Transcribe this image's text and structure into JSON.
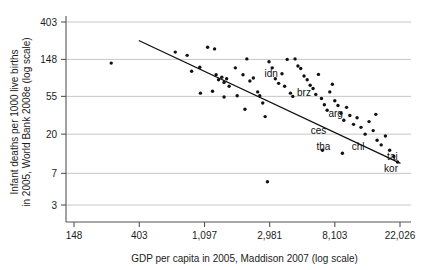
{
  "chart_data": {
    "type": "scatter",
    "title": "",
    "xlabel": "GDP per capita in 2005, Maddison 2007 (log scale)",
    "ylabel_line1": "Infant deaths per 1000 live births",
    "ylabel_line2": "in 2005, World Bank 2008e (log scale)",
    "x_scale": "log",
    "y_scale": "log",
    "xticks": [
      "148",
      "403",
      "1,097",
      "2,981",
      "8,103",
      "22,026"
    ],
    "xtick_values": [
      148,
      403,
      1097,
      2981,
      8103,
      22026
    ],
    "yticks": [
      "403",
      "148",
      "55",
      "20",
      "7",
      "3"
    ],
    "ytick_values": [
      403,
      148,
      55,
      20,
      7,
      3
    ],
    "xlim": [
      148,
      22026
    ],
    "ylim": [
      3,
      403
    ],
    "grid": "horizontal",
    "legend": "none",
    "marker_color": "#111111",
    "grid_color": "#b9b9b9",
    "axis_color": "#555555",
    "fit_line": {
      "label": "linear fit in log-log space",
      "x_start": 403,
      "y_start": 244,
      "x_end": 22026,
      "y_end": 9.2
    },
    "points": [
      {
        "x": 262,
        "y": 134
      },
      {
        "x": 700,
        "y": 180
      },
      {
        "x": 840,
        "y": 165
      },
      {
        "x": 900,
        "y": 108
      },
      {
        "x": 1020,
        "y": 120
      },
      {
        "x": 1150,
        "y": 205
      },
      {
        "x": 1280,
        "y": 196
      },
      {
        "x": 1310,
        "y": 98
      },
      {
        "x": 1360,
        "y": 86
      },
      {
        "x": 1430,
        "y": 92
      },
      {
        "x": 1480,
        "y": 80
      },
      {
        "x": 1540,
        "y": 88
      },
      {
        "x": 1600,
        "y": 72
      },
      {
        "x": 1480,
        "y": 54
      },
      {
        "x": 1760,
        "y": 118
      },
      {
        "x": 1980,
        "y": 98
      },
      {
        "x": 2100,
        "y": 150
      },
      {
        "x": 2200,
        "y": 83
      },
      {
        "x": 2320,
        "y": 90
      },
      {
        "x": 2480,
        "y": 62
      },
      {
        "x": 2560,
        "y": 56
      },
      {
        "x": 2680,
        "y": 46
      },
      {
        "x": 2780,
        "y": 32
      },
      {
        "x": 2950,
        "y": 139
      },
      {
        "x": 3100,
        "y": 118
      },
      {
        "x": 3250,
        "y": 88
      },
      {
        "x": 3420,
        "y": 78
      },
      {
        "x": 3600,
        "y": 101
      },
      {
        "x": 3750,
        "y": 72
      },
      {
        "x": 3900,
        "y": 148
      },
      {
        "x": 4100,
        "y": 60
      },
      {
        "x": 4250,
        "y": 55
      },
      {
        "x": 4400,
        "y": 150
      },
      {
        "x": 4600,
        "y": 124
      },
      {
        "x": 4800,
        "y": 116
      },
      {
        "x": 5050,
        "y": 95
      },
      {
        "x": 5300,
        "y": 86
      },
      {
        "x": 5550,
        "y": 74
      },
      {
        "x": 5800,
        "y": 68
      },
      {
        "x": 6050,
        "y": 58
      },
      {
        "x": 6300,
        "y": 99
      },
      {
        "x": 6600,
        "y": 52
      },
      {
        "x": 6900,
        "y": 44
      },
      {
        "x": 7200,
        "y": 38
      },
      {
        "x": 7500,
        "y": 62
      },
      {
        "x": 7800,
        "y": 76
      },
      {
        "x": 8100,
        "y": 49
      },
      {
        "x": 8500,
        "y": 43
      },
      {
        "x": 8900,
        "y": 35
      },
      {
        "x": 9300,
        "y": 29
      },
      {
        "x": 9700,
        "y": 41
      },
      {
        "x": 10200,
        "y": 33
      },
      {
        "x": 10800,
        "y": 26
      },
      {
        "x": 11400,
        "y": 31
      },
      {
        "x": 12100,
        "y": 24
      },
      {
        "x": 12900,
        "y": 20
      },
      {
        "x": 13700,
        "y": 28
      },
      {
        "x": 14600,
        "y": 22
      },
      {
        "x": 15500,
        "y": 17
      },
      {
        "x": 16500,
        "y": 15
      },
      {
        "x": 17600,
        "y": 19
      },
      {
        "x": 18800,
        "y": 13
      },
      {
        "x": 20000,
        "y": 11
      },
      {
        "x": 21200,
        "y": 9.5
      },
      {
        "x": 2880,
        "y": 5.6
      },
      {
        "x": 15200,
        "y": 34
      },
      {
        "x": 1030,
        "y": 60
      },
      {
        "x": 1240,
        "y": 63
      },
      {
        "x": 1810,
        "y": 56
      },
      {
        "x": 2040,
        "y": 39
      },
      {
        "x": 6700,
        "y": 13
      },
      {
        "x": 9100,
        "y": 12
      }
    ],
    "annotations": [
      {
        "text": "idn",
        "x": 3050,
        "y": 93
      },
      {
        "text": "brz",
        "x": 5050,
        "y": 55
      },
      {
        "text": "arg",
        "x": 8200,
        "y": 32
      },
      {
        "text": "ces",
        "x": 6300,
        "y": 20
      },
      {
        "text": "tha",
        "x": 6800,
        "y": 13
      },
      {
        "text": "chl",
        "x": 11600,
        "y": 13
      },
      {
        "text": "tai",
        "x": 19600,
        "y": 10
      },
      {
        "text": "kor",
        "x": 19200,
        "y": 7.2
      }
    ]
  }
}
